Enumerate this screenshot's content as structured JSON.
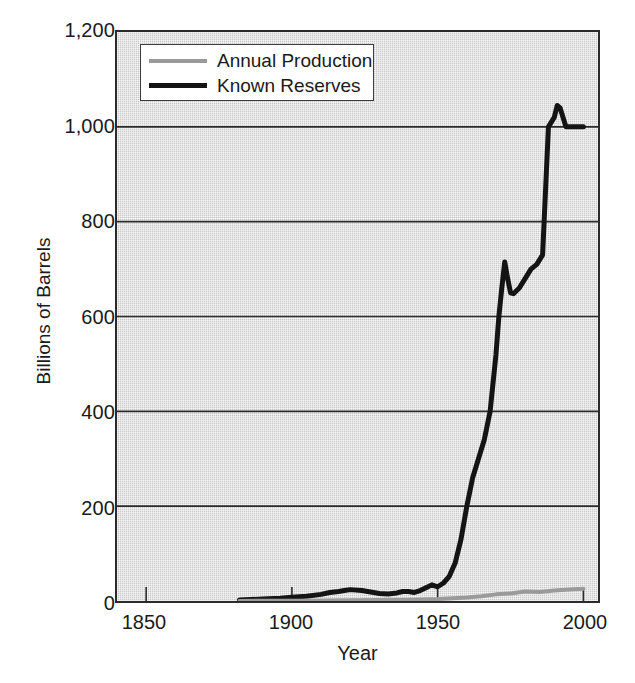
{
  "chart_data": {
    "type": "line",
    "title": "",
    "xlabel": "Year",
    "ylabel": "Billions of Barrels",
    "xlim": [
      1840,
      2005
    ],
    "ylim": [
      0,
      1200
    ],
    "xticks": [
      1850,
      1900,
      1950,
      2000
    ],
    "xtick_labels": [
      "1850",
      "1900",
      "1950",
      "2000"
    ],
    "yticks": [
      0,
      200,
      400,
      600,
      800,
      1000,
      1200
    ],
    "ytick_labels": [
      "0",
      "200",
      "400",
      "600",
      "800",
      "1,000",
      "1,200"
    ],
    "grid": "horizontal",
    "legend_position": "top-left-inside",
    "series": [
      {
        "name": "Known Reserves",
        "color": "#141414",
        "linewidth": 5,
        "x": [
          1882,
          1890,
          1896,
          1900,
          1905,
          1910,
          1913,
          1916,
          1918,
          1920,
          1924,
          1928,
          1930,
          1933,
          1936,
          1938,
          1940,
          1942,
          1944,
          1946,
          1948,
          1950,
          1952,
          1954,
          1956,
          1958,
          1960,
          1962,
          1964,
          1966,
          1968,
          1970,
          1971,
          1972,
          1973,
          1974,
          1975,
          1976,
          1978,
          1980,
          1982,
          1984,
          1986,
          1988,
          1989,
          1990,
          1991,
          1992,
          1994,
          1996,
          1998,
          2000
        ],
        "y": [
          2,
          4,
          6,
          8,
          10,
          14,
          18,
          20,
          22,
          24,
          22,
          18,
          16,
          15,
          17,
          20,
          20,
          18,
          22,
          28,
          34,
          30,
          38,
          52,
          80,
          130,
          200,
          260,
          300,
          340,
          400,
          520,
          600,
          660,
          715,
          680,
          650,
          648,
          660,
          680,
          700,
          710,
          730,
          1000,
          1010,
          1020,
          1045,
          1040,
          1000,
          1000,
          1000,
          1000
        ]
      },
      {
        "name": "Annual Production",
        "color": "#9a9a9a",
        "linewidth": 4,
        "x": [
          1882,
          1890,
          1900,
          1910,
          1920,
          1930,
          1940,
          1950,
          1960,
          1965,
          1970,
          1975,
          1980,
          1985,
          1990,
          1995,
          2000
        ],
        "y": [
          0.2,
          0.4,
          0.6,
          1.0,
          1.5,
          2.0,
          2.5,
          4.0,
          7.5,
          10.0,
          14.0,
          16.0,
          20.0,
          19.0,
          22.0,
          24.0,
          26.0
        ]
      }
    ],
    "annotations": []
  },
  "legend": {
    "items": [
      {
        "label": "Annual Production"
      },
      {
        "label": "Known Reserves"
      }
    ]
  },
  "margin_note": ""
}
